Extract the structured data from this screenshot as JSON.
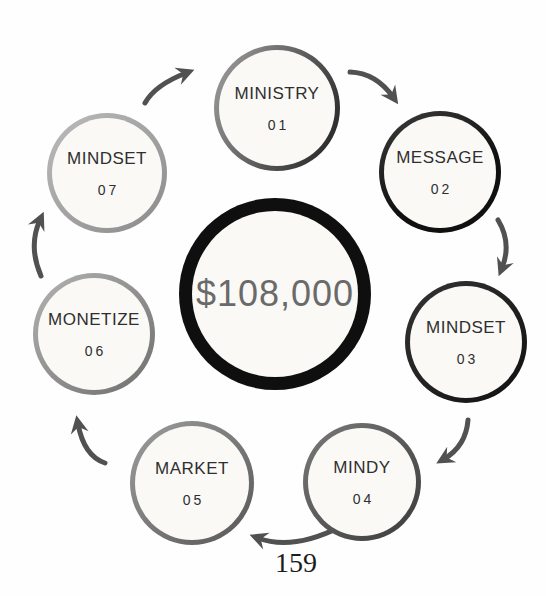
{
  "page": {
    "number": "159"
  },
  "diagram": {
    "center": {
      "label": "$108,000"
    },
    "steps": [
      {
        "label": "MINISTRY",
        "number": "01"
      },
      {
        "label": "MESSAGE",
        "number": "02"
      },
      {
        "label": "MINDSET",
        "number": "03"
      },
      {
        "label": "MINDY",
        "number": "04"
      },
      {
        "label": "MARKET",
        "number": "05"
      },
      {
        "label": "MONETIZE",
        "number": "06"
      },
      {
        "label": "MINDSET",
        "number": "07"
      }
    ],
    "colors": {
      "center_border": "#0f0f0f",
      "center_text": "#6a6a6a",
      "label_text": "#2f2f2f",
      "circle_fill": "#faf9f6",
      "arrow": "#515151"
    }
  }
}
